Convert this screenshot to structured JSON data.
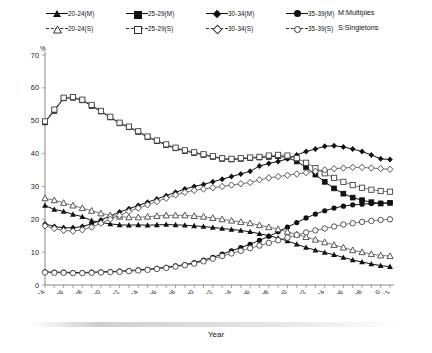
{
  "legend": {
    "rows": [
      [
        {
          "label": "20-24(M)",
          "marker": "triangle-filled",
          "style": "solid"
        },
        {
          "label": "25-29(M)",
          "marker": "square-filled",
          "style": "solid"
        },
        {
          "label": "30-34(M)",
          "marker": "diamond-filled",
          "style": "solid"
        },
        {
          "label": "35-39(M)",
          "marker": "circle-filled",
          "style": "solid"
        }
      ],
      [
        {
          "label": "20-24(S)",
          "marker": "triangle-hollow",
          "style": "dashed"
        },
        {
          "label": "25-29(S)",
          "marker": "square-hollow",
          "style": "dashed"
        },
        {
          "label": "30-34(S)",
          "marker": "diamond-hollow",
          "style": "dashed"
        },
        {
          "label": "35-39(S)",
          "marker": "circle-hollow",
          "style": "dashed"
        }
      ]
    ],
    "note_multiples": "M:Multiples",
    "note_singletons": "S:Singletons"
  },
  "chart_data": {
    "type": "line",
    "title": "",
    "xlabel": "Year",
    "ylabel": "%",
    "unit_symbol": "%",
    "xlim": [
      1974,
      2011
    ],
    "ylim": [
      0,
      70
    ],
    "ytick_step": 10,
    "yticks": [
      0,
      10,
      20,
      30,
      40,
      50,
      60,
      70
    ],
    "xticks": [
      1974,
      1976,
      1978,
      1980,
      1982,
      1984,
      1986,
      1988,
      1990,
      1992,
      1994,
      1996,
      1998,
      2000,
      2002,
      2004,
      2006,
      2008,
      2010,
      2011
    ],
    "grid": false,
    "legend_position": "top",
    "x": [
      1974,
      1975,
      1976,
      1977,
      1978,
      1979,
      1980,
      1981,
      1982,
      1983,
      1984,
      1985,
      1986,
      1987,
      1988,
      1989,
      1990,
      1991,
      1992,
      1993,
      1994,
      1995,
      1996,
      1997,
      1998,
      1999,
      2000,
      2001,
      2002,
      2003,
      2004,
      2005,
      2006,
      2007,
      2008,
      2009,
      2010,
      2011
    ],
    "series": [
      {
        "name": "20-24(M)",
        "marker": "triangle-filled",
        "style": "solid",
        "values": [
          24.2,
          23.0,
          22.4,
          21.5,
          20.8,
          19.6,
          19.0,
          18.6,
          18.3,
          18.2,
          18.3,
          18.2,
          18.3,
          18.4,
          18.3,
          18.2,
          18.0,
          17.8,
          17.5,
          17.2,
          16.9,
          16.6,
          16.2,
          15.6,
          15.0,
          14.3,
          13.4,
          12.4,
          11.4,
          10.6,
          9.9,
          9.2,
          8.4,
          7.6,
          7.0,
          6.4,
          5.9,
          5.6
        ]
      },
      {
        "name": "25-29(M)",
        "marker": "square-filled",
        "style": "solid",
        "values": [
          49.5,
          53.0,
          56.8,
          57.0,
          56.2,
          54.5,
          52.8,
          51.0,
          49.2,
          48.0,
          46.6,
          45.0,
          43.8,
          42.6,
          41.6,
          40.8,
          40.2,
          39.6,
          39.0,
          38.4,
          38.2,
          38.4,
          38.6,
          38.8,
          39.0,
          39.2,
          38.8,
          37.6,
          35.8,
          33.6,
          31.4,
          29.4,
          27.8,
          26.6,
          25.8,
          25.2,
          24.8,
          25.0
        ]
      },
      {
        "name": "30-34(M)",
        "marker": "diamond-filled",
        "style": "solid",
        "values": [
          18.6,
          17.8,
          17.4,
          17.4,
          17.8,
          18.6,
          19.8,
          21.0,
          22.2,
          23.2,
          24.2,
          25.2,
          26.2,
          27.2,
          28.2,
          29.2,
          30.0,
          30.6,
          31.4,
          32.2,
          33.0,
          33.8,
          34.6,
          36.2,
          37.0,
          37.6,
          38.4,
          39.6,
          40.6,
          41.4,
          42.2,
          42.4,
          42.0,
          41.4,
          40.6,
          39.6,
          38.4,
          38.2
        ]
      },
      {
        "name": "35-39(M)",
        "marker": "circle-filled",
        "style": "solid",
        "values": [
          4.0,
          3.9,
          3.9,
          3.8,
          3.8,
          3.9,
          4.0,
          4.1,
          4.2,
          4.4,
          4.6,
          4.8,
          5.1,
          5.4,
          5.8,
          6.2,
          6.8,
          7.6,
          8.4,
          9.4,
          10.4,
          11.4,
          12.4,
          13.6,
          14.8,
          16.2,
          17.6,
          19.0,
          20.4,
          21.6,
          22.6,
          23.4,
          24.0,
          24.4,
          24.6,
          24.8,
          24.9,
          25.0
        ]
      },
      {
        "name": "20-24(S)",
        "marker": "triangle-hollow",
        "style": "dashed",
        "values": [
          26.4,
          25.8,
          25.0,
          24.2,
          23.4,
          22.6,
          21.8,
          21.2,
          20.8,
          20.6,
          20.6,
          20.8,
          21.0,
          21.2,
          21.2,
          21.2,
          21.0,
          20.8,
          20.4,
          20.0,
          19.6,
          19.2,
          18.8,
          18.2,
          17.6,
          17.0,
          16.2,
          15.4,
          14.6,
          13.8,
          13.0,
          12.2,
          11.4,
          10.6,
          10.0,
          9.4,
          9.0,
          8.8
        ]
      },
      {
        "name": "25-29(S)",
        "marker": "square-hollow",
        "style": "dashed",
        "values": [
          49.8,
          53.4,
          57.0,
          57.2,
          56.4,
          54.8,
          53.0,
          51.2,
          49.4,
          48.2,
          46.8,
          45.2,
          44.0,
          42.8,
          41.8,
          41.0,
          40.4,
          39.8,
          39.2,
          38.6,
          38.4,
          38.6,
          38.8,
          39.0,
          39.4,
          39.6,
          39.4,
          38.6,
          37.2,
          35.6,
          34.0,
          32.6,
          31.4,
          30.4,
          29.6,
          29.0,
          28.6,
          28.4
        ]
      },
      {
        "name": "30-34(S)",
        "marker": "diamond-hollow",
        "style": "dashed",
        "values": [
          18.0,
          17.2,
          16.6,
          16.4,
          16.8,
          17.6,
          18.8,
          20.0,
          21.2,
          22.4,
          23.4,
          24.4,
          25.4,
          26.4,
          27.4,
          28.2,
          28.8,
          29.2,
          29.6,
          30.0,
          30.4,
          30.8,
          31.2,
          32.0,
          32.6,
          33.0,
          33.4,
          33.8,
          34.2,
          34.6,
          35.0,
          35.4,
          35.6,
          35.8,
          35.8,
          35.6,
          35.4,
          35.2
        ]
      },
      {
        "name": "35-39(S)",
        "marker": "circle-hollow",
        "style": "dashed",
        "values": [
          3.8,
          3.7,
          3.7,
          3.6,
          3.6,
          3.7,
          3.8,
          3.9,
          4.0,
          4.2,
          4.4,
          4.6,
          4.9,
          5.2,
          5.6,
          6.0,
          6.5,
          7.2,
          8.0,
          8.8,
          9.6,
          10.4,
          11.2,
          12.0,
          12.8,
          13.6,
          14.4,
          15.2,
          16.0,
          16.6,
          17.2,
          17.8,
          18.4,
          18.8,
          19.2,
          19.5,
          19.8,
          20.0
        ]
      }
    ]
  },
  "caption": ""
}
